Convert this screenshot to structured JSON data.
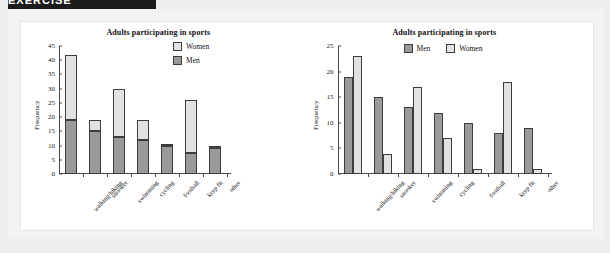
{
  "banner": {
    "text": "EXERCISE"
  },
  "colors": {
    "men": "#9a9a9a",
    "women": "#e2e2e2",
    "outline": "#3d3d3d",
    "axis": "#4a4a4a",
    "page_bg": "#ededed",
    "panel_bg": "#ffffff"
  },
  "chart_data": [
    {
      "type": "bar",
      "subtype": "stacked",
      "title": "Adults participating in sports",
      "xlabel": "",
      "ylabel": "Frequency",
      "ylim": [
        0,
        45
      ],
      "yticks": [
        0,
        5,
        10,
        15,
        20,
        25,
        30,
        35,
        40,
        45
      ],
      "grid": false,
      "legend_position": "top-right",
      "legend": [
        "Women",
        "Men"
      ],
      "categories": [
        "walking/hiking",
        "snooker",
        "swimming",
        "cycling",
        "football",
        "keep fit",
        "other"
      ],
      "series": [
        {
          "name": "Men",
          "values": [
            19,
            15,
            13,
            12,
            10,
            7.5,
            9
          ]
        },
        {
          "name": "Women",
          "values": [
            23,
            4,
            17,
            7,
            0.5,
            18.5,
            1
          ]
        }
      ],
      "totals": [
        42,
        19,
        30,
        19,
        10.5,
        26,
        10
      ]
    },
    {
      "type": "bar",
      "subtype": "grouped",
      "title": "Adults participating in sports",
      "xlabel": "",
      "ylabel": "Frequency",
      "ylim": [
        0,
        25
      ],
      "yticks": [
        0,
        5,
        10,
        15,
        20,
        25
      ],
      "grid": false,
      "legend_position": "top-right",
      "legend": [
        "Men",
        "Women"
      ],
      "categories": [
        "walking/hiking",
        "snooker",
        "swimming",
        "cycling",
        "football",
        "keep fit",
        "other"
      ],
      "series": [
        {
          "name": "Men",
          "values": [
            19,
            15,
            13,
            12,
            10,
            8,
            9
          ]
        },
        {
          "name": "Women",
          "values": [
            23,
            4,
            17,
            7,
            1,
            18,
            1
          ]
        }
      ]
    }
  ]
}
